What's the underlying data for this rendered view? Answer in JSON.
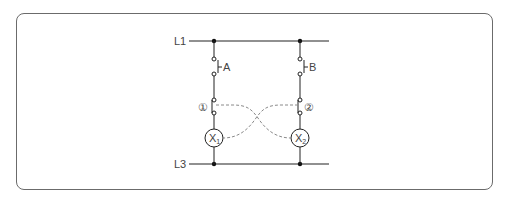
{
  "diagram": {
    "type": "relay-interlock-circuit",
    "rails": {
      "top": {
        "label": "L1"
      },
      "bottom": {
        "label": "L3"
      }
    },
    "branches": [
      {
        "switch_label": "A",
        "interlock_contact_label": "①",
        "lamp_label": "X",
        "lamp_subscript": "1"
      },
      {
        "switch_label": "B",
        "interlock_contact_label": "②",
        "lamp_label": "X",
        "lamp_subscript": "2"
      }
    ],
    "colors": {
      "line": "#222222",
      "dashed_link": "#8a8a8a",
      "frame": "#6b6b6b",
      "text": "#444444"
    }
  }
}
